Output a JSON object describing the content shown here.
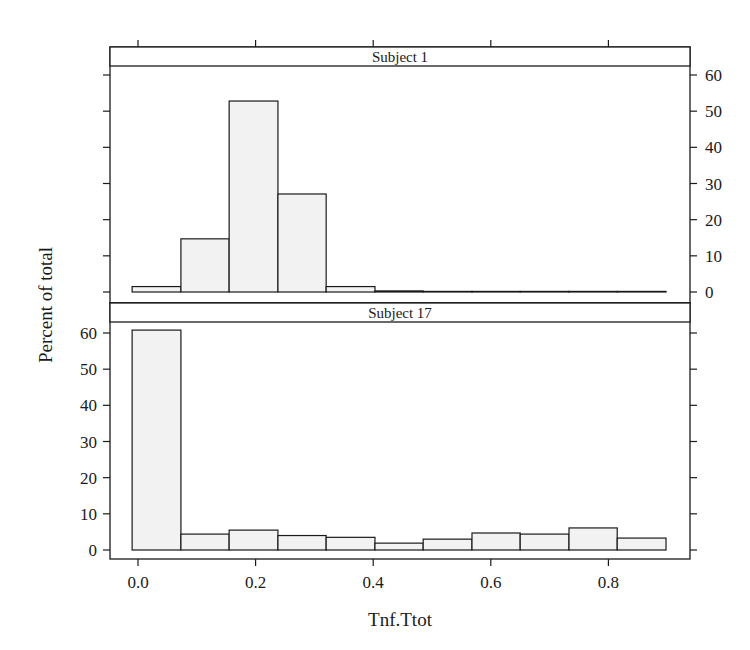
{
  "chart_data": {
    "type": "bar",
    "subtype": "histogram",
    "layout": "lattice-2-panel-vertical",
    "xlabel": "Tnf.Ttot",
    "ylabel": "Percent of total",
    "x_ticks": [
      "0.0",
      "0.2",
      "0.4",
      "0.6",
      "0.8"
    ],
    "x_tick_values": [
      0.0,
      0.2,
      0.4,
      0.6,
      0.8
    ],
    "xlim": [
      -0.05,
      0.98
    ],
    "y_ticks": [
      "0",
      "10",
      "20",
      "30",
      "40",
      "50",
      "60"
    ],
    "y_tick_values": [
      0,
      10,
      20,
      30,
      40,
      50,
      60
    ],
    "ylim": [
      -2.5,
      63
    ],
    "bin_edges": [
      -0.01,
      0.073,
      0.155,
      0.238,
      0.32,
      0.403,
      0.485,
      0.568,
      0.65,
      0.733,
      0.815,
      0.898
    ],
    "grid": false,
    "legend": null,
    "colors": {
      "bar_fill": "#f2f2f2",
      "bar_stroke": "#1a1a1a",
      "strip_bg": "#ffffff",
      "axis": "#1a1a1a"
    },
    "panels": [
      {
        "strip_label": "Subject 1",
        "y_axis_side": "right",
        "values": [
          1.5,
          14.7,
          52.8,
          27.1,
          1.5,
          0.3,
          0.0,
          0.0,
          0.0,
          0.0,
          0.0
        ]
      },
      {
        "strip_label": "Subject 17",
        "y_axis_side": "left",
        "values": [
          60.8,
          4.4,
          5.5,
          4.0,
          3.5,
          1.9,
          3.0,
          4.7,
          4.4,
          6.1,
          3.3
        ]
      }
    ]
  }
}
